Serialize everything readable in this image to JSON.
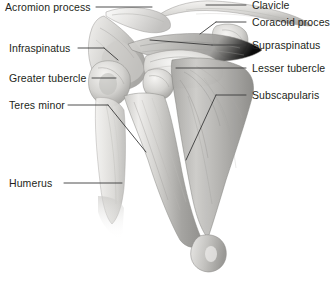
{
  "figure": {
    "view": "anterior",
    "background_color": "#ffffff",
    "text_color": "#231f20",
    "leader_color": "#3a3a3a",
    "art_style": "grayscale pencil/airbrush medical illustration"
  },
  "labels": {
    "left": [
      {
        "text": "Acromion process",
        "x": 5,
        "y": 2
      },
      {
        "text": "Infraspinatus",
        "x": 9,
        "y": 43
      },
      {
        "text": "Greater tubercle",
        "x": 9,
        "y": 73
      },
      {
        "text": "Teres minor",
        "x": 9,
        "y": 100
      },
      {
        "text": "Humerus",
        "x": 9,
        "y": 178
      }
    ],
    "right": [
      {
        "text": "Clavicle",
        "x": 252,
        "y": 0
      },
      {
        "text": "Coracoid proces",
        "x": 252,
        "y": 17
      },
      {
        "text": "Supraspinatus",
        "x": 252,
        "y": 40
      },
      {
        "text": "Lesser tubercle",
        "x": 252,
        "y": 63
      },
      {
        "text": "Subscapularis",
        "x": 252,
        "y": 90
      }
    ]
  },
  "structures": [
    "clavicle",
    "acromion process",
    "scapula",
    "coracoid process",
    "supraspinatus",
    "infraspinatus",
    "teres minor",
    "subscapularis",
    "greater tubercle",
    "lesser tubercle",
    "humeral head",
    "humerus shaft",
    "distal humerus"
  ]
}
